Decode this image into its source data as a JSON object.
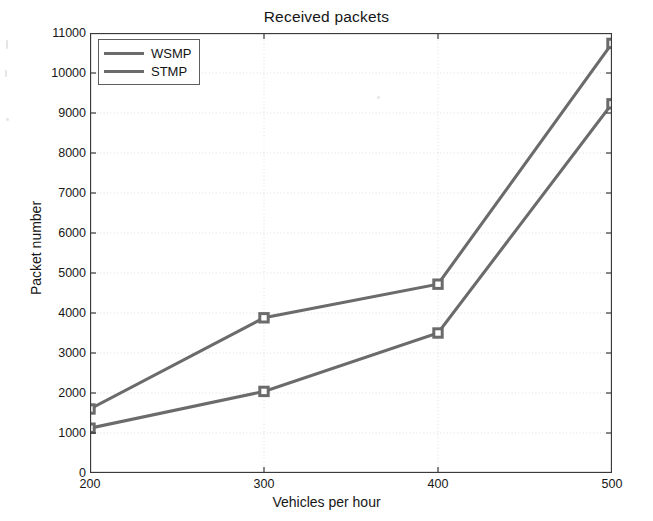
{
  "chart_data": {
    "type": "line",
    "title": "Received packets",
    "xlabel": "Vehicles per hour",
    "ylabel": "Packet number",
    "x": [
      200,
      300,
      400,
      500
    ],
    "xtick_labels": [
      "200",
      "300",
      "400",
      "500"
    ],
    "ytick_labels": [
      "0",
      "1000",
      "2000",
      "3000",
      "4000",
      "5000",
      "6000",
      "7000",
      "8000",
      "9000",
      "10000",
      "11000"
    ],
    "ytick_values": [
      0,
      1000,
      2000,
      3000,
      4000,
      5000,
      6000,
      7000,
      8000,
      9000,
      10000,
      11000
    ],
    "xlim": [
      200,
      500
    ],
    "ylim": [
      0,
      11000
    ],
    "grid": true,
    "grid_style": "dotted",
    "legend_position": "top-left",
    "marker": "square",
    "series": [
      {
        "name": "WSMP",
        "color": "#6b6b6b",
        "values": [
          1600,
          3880,
          4720,
          10740
        ]
      },
      {
        "name": "STMP",
        "color": "#6b6b6b",
        "values": [
          1120,
          2040,
          3500,
          9230
        ]
      }
    ]
  },
  "legend": {
    "items": [
      {
        "label": "WSMP"
      },
      {
        "label": "STMP"
      }
    ]
  },
  "colors": {
    "line": "#6b6b6b",
    "axis": "#3a3a3a",
    "grid": "#dedede",
    "background": "#ffffff",
    "text": "#171717"
  }
}
